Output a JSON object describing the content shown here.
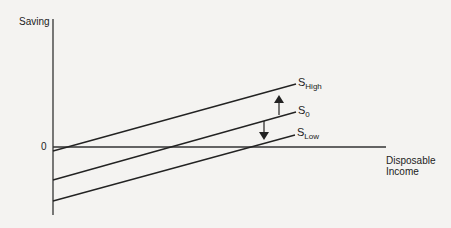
{
  "diagram": {
    "y_axis_label": "Saving",
    "x_axis_label_line1": "Disposable",
    "x_axis_label_line2": "Income",
    "origin_label": "0",
    "curves": [
      {
        "name": "S",
        "subscript": "High",
        "start": [
          53,
          151
        ],
        "end": [
          296,
          84
        ]
      },
      {
        "name": "S",
        "subscript": "0",
        "start": [
          53,
          180
        ],
        "end": [
          296,
          112
        ]
      },
      {
        "name": "S",
        "subscript": "Low",
        "start": [
          53,
          201
        ],
        "end": [
          295,
          135
        ]
      }
    ],
    "arrows": [
      {
        "direction": "up",
        "meaning": "shift from S0 to SHigh"
      },
      {
        "direction": "down",
        "meaning": "shift from S0 to SLow"
      }
    ],
    "line_color": "#222222"
  }
}
